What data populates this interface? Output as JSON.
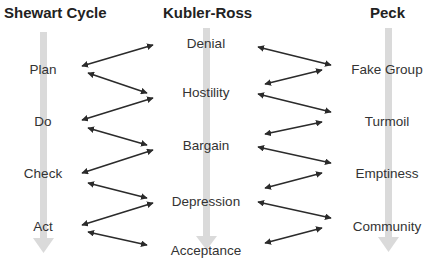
{
  "columns": [
    {
      "id": "shewart",
      "title": "Shewart  Cycle",
      "stages": [
        "Plan",
        "Do",
        "Check",
        "Act"
      ]
    },
    {
      "id": "kubler-ross",
      "title": "Kubler-Ross",
      "stages": [
        "Denial",
        "Hostility",
        "Bargain",
        "Depression",
        "Acceptance"
      ]
    },
    {
      "id": "peck",
      "title": "Peck",
      "stages": [
        "Fake Group",
        "Turmoil",
        "Emptiness",
        "Community"
      ]
    }
  ],
  "colors": {
    "flow_arrow": "#d9d9d9",
    "link_arrow": "#2b2b2b",
    "text": "#333333"
  },
  "links": {
    "left": [
      {
        "from": "Plan",
        "to": "Denial"
      },
      {
        "from": "Plan",
        "to": "Hostility"
      },
      {
        "from": "Do",
        "to": "Hostility"
      },
      {
        "from": "Do",
        "to": "Bargain"
      },
      {
        "from": "Check",
        "to": "Bargain"
      },
      {
        "from": "Check",
        "to": "Depression"
      },
      {
        "from": "Act",
        "to": "Depression"
      },
      {
        "from": "Act",
        "to": "Acceptance"
      }
    ],
    "right": [
      {
        "from": "Denial",
        "to": "Fake Group"
      },
      {
        "from": "Hostility",
        "to": "Fake Group"
      },
      {
        "from": "Hostility",
        "to": "Turmoil"
      },
      {
        "from": "Bargain",
        "to": "Turmoil"
      },
      {
        "from": "Bargain",
        "to": "Emptiness"
      },
      {
        "from": "Depression",
        "to": "Emptiness"
      },
      {
        "from": "Depression",
        "to": "Community"
      },
      {
        "from": "Acceptance",
        "to": "Community"
      }
    ]
  }
}
